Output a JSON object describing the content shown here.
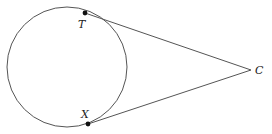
{
  "diagram": {
    "type": "circle-with-two-tangents",
    "colors": {
      "stroke": "#555555",
      "point": "#111111",
      "label": "#222222"
    },
    "circle": {
      "cx": 67,
      "cy": 67,
      "r": 60
    },
    "points": [
      {
        "id": "T",
        "label": "T",
        "x": 85,
        "y": 13,
        "label_x": 78,
        "label_y": 28
      },
      {
        "id": "X",
        "label": "X",
        "x": 88,
        "y": 124,
        "label_x": 81,
        "label_y": 118
      },
      {
        "id": "C",
        "label": "C",
        "x": 251,
        "y": 70,
        "label_x": 255,
        "label_y": 74
      }
    ],
    "segments": [
      {
        "from": "T",
        "to": "C"
      },
      {
        "from": "X",
        "to": "C"
      }
    ]
  }
}
